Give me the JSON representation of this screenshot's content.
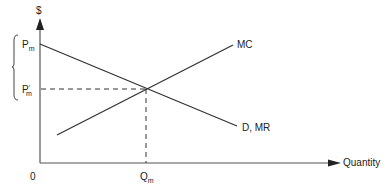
{
  "diagram": {
    "type": "monopoly-pricing",
    "y_axis_label": "$",
    "x_axis_label": "Quantity",
    "origin_label": "0",
    "price_labels": {
      "pm": {
        "main": "P",
        "sub": "m"
      },
      "pm_prime": {
        "main": "P",
        "prime": "′",
        "sub": "m"
      }
    },
    "quantity_label": {
      "main": "Q",
      "sub": "m"
    },
    "curves": [
      {
        "name": "MC",
        "label": "MC",
        "slope": "upward"
      },
      {
        "name": "D,MR",
        "label": "D, MR",
        "slope": "downward"
      }
    ],
    "annotations": {
      "brace": "bracket spanning Pm to P'm",
      "dashed_lines": [
        "horizontal at P'm to intersection",
        "vertical from intersection to Qm"
      ]
    },
    "colors": {
      "line": "#333333",
      "axis": "#555555",
      "text": "#222222"
    }
  }
}
